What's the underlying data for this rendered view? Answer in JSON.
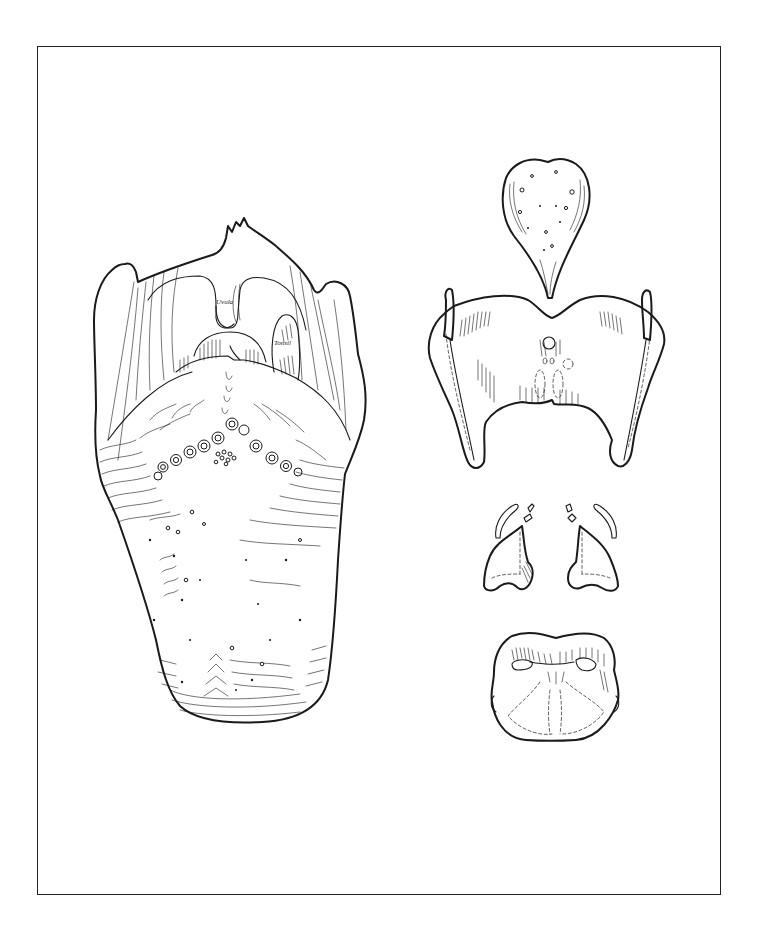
{
  "plate": {
    "frame_color": "#222222",
    "background": "#ffffff"
  },
  "figures": {
    "tongue": {
      "name": "Tongue with pharynx (dorsal view)",
      "labels": {
        "uvula": "Uvula",
        "tonsil": "Tonsil"
      }
    },
    "epiglottis": {
      "name": "Epiglottis"
    },
    "thyroid_cartilage": {
      "name": "Thyroid cartilage"
    },
    "arytenoid_cartilages": {
      "name": "Arytenoid and corniculate cartilages (pair)"
    },
    "cricoid_cartilage": {
      "name": "Cricoid cartilage"
    }
  },
  "colors": {
    "ink": "#1a1a1a",
    "paper": "#ffffff"
  }
}
